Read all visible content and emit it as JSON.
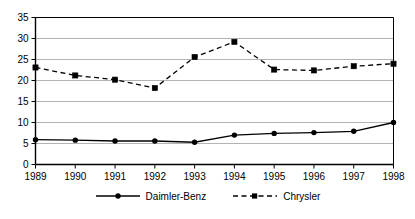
{
  "chart_data": {
    "type": "line",
    "title": "",
    "subtitle": "",
    "xlabel": "",
    "ylabel": "",
    "x": [
      1989,
      1990,
      1991,
      1992,
      1993,
      1994,
      1995,
      1996,
      1997,
      1998
    ],
    "categories": [
      "1989",
      "1990",
      "1991",
      "1992",
      "1993",
      "1994",
      "1995",
      "1996",
      "1997",
      "1998"
    ],
    "series": [
      {
        "name": "Daimler-Benz",
        "values": [
          5.9,
          5.8,
          5.6,
          5.6,
          5.3,
          7.0,
          7.4,
          7.6,
          7.9,
          10.0
        ],
        "marker": "circle",
        "line_style": "solid",
        "color": "#000000"
      },
      {
        "name": "Chrysler",
        "values": [
          23.1,
          21.2,
          20.2,
          18.2,
          25.6,
          29.2,
          22.6,
          22.4,
          23.4,
          24.0
        ],
        "marker": "square",
        "line_style": "dashed",
        "color": "#000000"
      }
    ],
    "ylim": [
      0,
      35
    ],
    "yticks": [
      0,
      5,
      10,
      15,
      20,
      25,
      30,
      35
    ],
    "ytick_labels": [
      "0",
      "5",
      "10",
      "15",
      "20",
      "25",
      "30",
      "35"
    ],
    "xtick_labels": [
      "1989",
      "1990",
      "1991",
      "1992",
      "1993",
      "1994",
      "1995",
      "1996",
      "1997",
      "1998"
    ],
    "grid": "horizontal",
    "grid_color": "#b3b3b3",
    "axis_color": "#000000",
    "background": "#ffffff",
    "legend_position": "bottom",
    "legend": [
      "Daimler-Benz",
      "Chrysler"
    ]
  }
}
